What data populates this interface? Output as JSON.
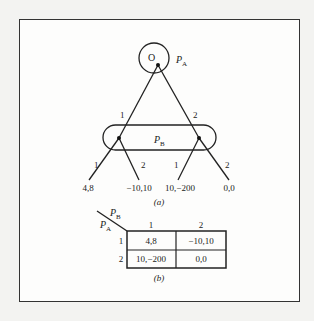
{
  "figure": {
    "tree": {
      "root": {
        "label": "O",
        "player": "P",
        "player_sub": "A"
      },
      "info_set": {
        "player": "P",
        "player_sub": "B"
      },
      "root_branches": [
        "1",
        "2"
      ],
      "left_node_branches": [
        "1",
        "2"
      ],
      "right_node_branches": [
        "1",
        "2"
      ],
      "payoffs": [
        "4,8",
        "−10,10",
        "10,−200",
        "0,0"
      ],
      "caption": "(a)"
    },
    "matrix": {
      "row_player": "P",
      "row_player_sub": "A",
      "col_player": "P",
      "col_player_sub": "B",
      "col_headers": [
        "1",
        "2"
      ],
      "row_headers": [
        "1",
        "2"
      ],
      "cells": [
        [
          "4,8",
          "−10,10"
        ],
        [
          "10,−200",
          "0,0"
        ]
      ],
      "caption": "(b)"
    }
  }
}
